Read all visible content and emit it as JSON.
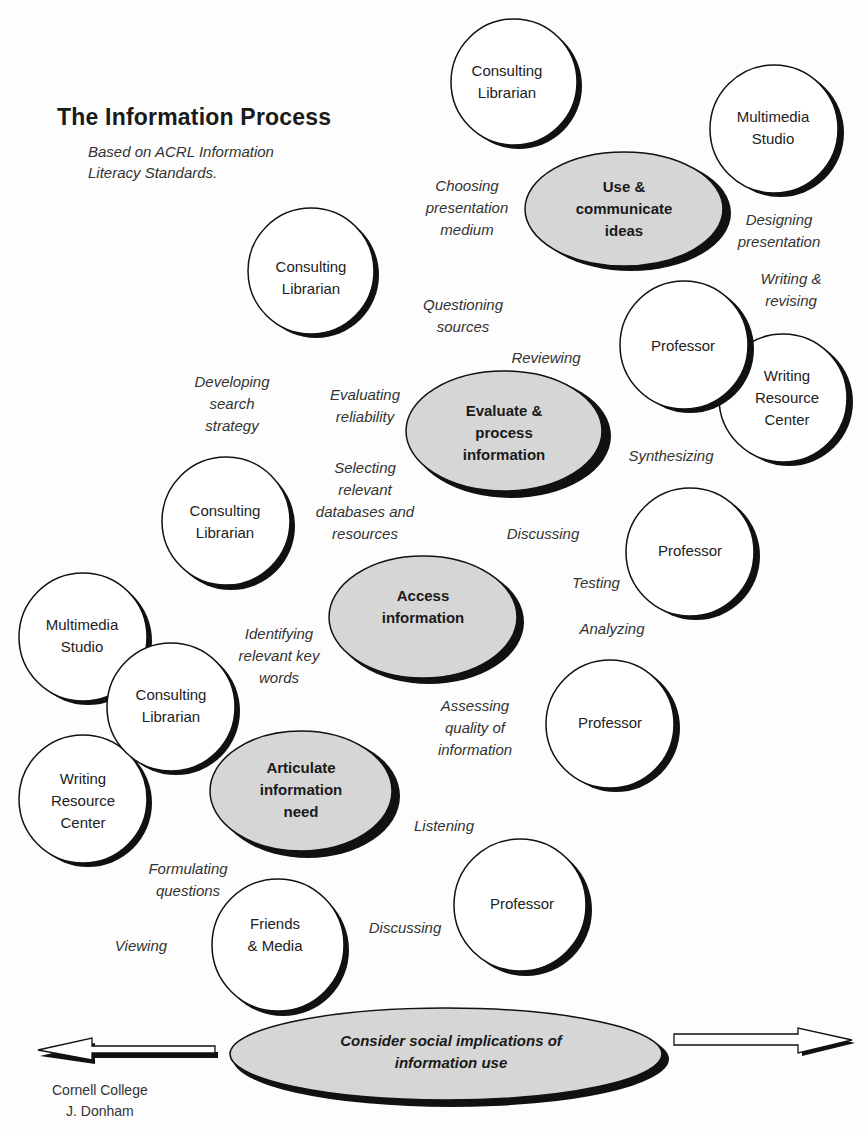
{
  "header": {
    "title": "The Information Process",
    "subtitle_line1": "Based on ACRL Information",
    "subtitle_line2": "Literacy Standards."
  },
  "colors": {
    "stage_fill": "#d6d6d6",
    "node_fill": "#ffffff",
    "outline": "#111111",
    "text": "#222222"
  },
  "stages": [
    {
      "id": "use",
      "line1": "Use &",
      "line2": "communicate",
      "line3": "ideas"
    },
    {
      "id": "evaluate",
      "line1": "Evaluate &",
      "line2": "process",
      "line3": "information"
    },
    {
      "id": "access",
      "line1": "Access",
      "line2": "information"
    },
    {
      "id": "articulate",
      "line1": "Articulate",
      "line2": "information",
      "line3": "need"
    },
    {
      "id": "social",
      "line1": "Consider social implications of",
      "line2": "information use"
    }
  ],
  "nodes": [
    {
      "line1": "Consulting",
      "line2": "Librarian"
    },
    {
      "line1": "Multimedia",
      "line2": "Studio"
    },
    {
      "line1": "Consulting",
      "line2": "Librarian"
    },
    {
      "line1": "Professor"
    },
    {
      "line1": "Writing",
      "line2": "Resource",
      "line3": "Center"
    },
    {
      "line1": "Consulting",
      "line2": "Librarian"
    },
    {
      "line1": "Professor"
    },
    {
      "line1": "Multimedia",
      "line2": "Studio"
    },
    {
      "line1": "Consulting",
      "line2": "Librarian"
    },
    {
      "line1": "Professor"
    },
    {
      "line1": "Writing",
      "line2": "Resource",
      "line3": "Center"
    },
    {
      "line1": "Friends",
      "line2": "& Media"
    },
    {
      "line1": "Professor"
    }
  ],
  "activities": [
    {
      "line1": "Choosing",
      "line2": "presentation",
      "line3": "medium"
    },
    {
      "line1": "Designing",
      "line2": "presentation"
    },
    {
      "line1": "Writing &",
      "line2": "revising"
    },
    {
      "line1": "Questioning",
      "line2": "sources"
    },
    {
      "line1": "Reviewing"
    },
    {
      "line1": "Developing",
      "line2": "search",
      "line3": "strategy"
    },
    {
      "line1": "Evaluating",
      "line2": "reliability"
    },
    {
      "line1": "Synthesizing"
    },
    {
      "line1": "Selecting",
      "line2": "relevant",
      "line3": "databases and",
      "line4": "resources"
    },
    {
      "line1": "Discussing"
    },
    {
      "line1": "Testing"
    },
    {
      "line1": "Analyzing"
    },
    {
      "line1": "Identifying",
      "line2": "relevant key",
      "line3": "words"
    },
    {
      "line1": "Assessing",
      "line2": "quality of",
      "line3": "information"
    },
    {
      "line1": "Listening"
    },
    {
      "line1": "Formulating",
      "line2": "questions"
    },
    {
      "line1": "Discussing"
    },
    {
      "line1": "Viewing"
    }
  ],
  "footer": {
    "credit_line1": "Cornell College",
    "credit_line2": "J. Donham"
  }
}
